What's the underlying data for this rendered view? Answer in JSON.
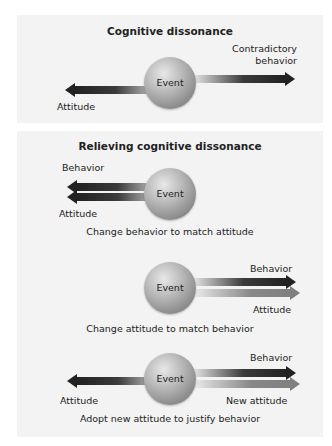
{
  "diagram": {
    "panel1": {
      "title": "Cognitive dissonance",
      "event": "Event",
      "right_label_line1": "Contradictory",
      "right_label_line2": "behavior",
      "left_label": "Attitude"
    },
    "panel2": {
      "title": "Relieving cognitive dissonance",
      "scenario1": {
        "event": "Event",
        "top_label": "Behavior",
        "bottom_label": "Attitude",
        "caption": "Change behavior to match attitude"
      },
      "scenario2": {
        "event": "Event",
        "top_label": "Behavior",
        "bottom_label": "Attitude",
        "caption": "Change attitude to match behavior"
      },
      "scenario3": {
        "event": "Event",
        "left_label": "Attitude",
        "top_label": "Behavior",
        "bottom_label": "New attitude",
        "caption": "Adopt new attitude to justify behavior"
      }
    },
    "colors": {
      "panel_bg": "#f3f3f3",
      "arrow_dark": "#222222",
      "arrow_gray": "#808080",
      "sphere": "#9a9a9a"
    }
  }
}
